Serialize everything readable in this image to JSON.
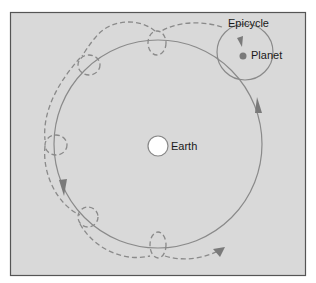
{
  "figure": {
    "caption_fragment": "",
    "background_color": "#d9d9d9",
    "frame_color": "#555555",
    "orbit_color": "#8a8a8a",
    "path_color": "#8a8a8a",
    "planet_color": "#7a7a7a",
    "earth_fill": "#ffffff"
  },
  "labels": {
    "epicycle": "Epicycle",
    "planet": "Planet",
    "earth": "Earth"
  },
  "diagram": {
    "deferent": {
      "cx": 158,
      "cy": 144,
      "r": 104
    },
    "epicycle": {
      "cx": 245,
      "cy": 52,
      "r": 28
    },
    "planet": {
      "cx": 243,
      "cy": 56,
      "r": 3.5
    },
    "earth": {
      "cx": 158,
      "cy": 146,
      "r": 10
    },
    "retrograde_loops": [
      {
        "cx": 157,
        "cy": 43
      },
      {
        "cx": 88,
        "cy": 64
      },
      {
        "cx": 55,
        "cy": 145
      },
      {
        "cx": 87,
        "cy": 217
      },
      {
        "cx": 158,
        "cy": 244
      }
    ]
  }
}
